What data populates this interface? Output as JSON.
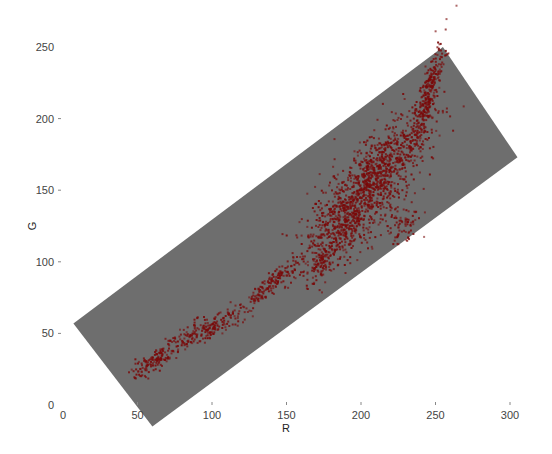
{
  "chart_data": {
    "type": "scatter",
    "title": "",
    "xlabel": "R",
    "ylabel": "G",
    "xlim": [
      0,
      300
    ],
    "ylim": [
      0,
      250
    ],
    "x_ticks": [
      0,
      50,
      100,
      150,
      200,
      250,
      300
    ],
    "y_ticks": [
      0,
      50,
      100,
      150,
      200,
      250
    ],
    "grid": false,
    "legend": null,
    "background_band": {
      "color": "#6e6e6e",
      "corners_rg": [
        [
          7,
          57
        ],
        [
          255,
          250
        ],
        [
          305,
          173
        ],
        [
          60,
          -15
        ]
      ]
    },
    "point_color": "#7a0a0a",
    "series": [
      {
        "name": "pixels",
        "clusters": [
          {
            "center": [
              210,
              160
            ],
            "spread": [
              18,
              22
            ],
            "n": 900,
            "corr": 0.75
          },
          {
            "center": [
              190,
              130
            ],
            "spread": [
              14,
              16
            ],
            "n": 500,
            "corr": 0.6
          },
          {
            "center": [
              245,
              215
            ],
            "spread": [
              5,
              18
            ],
            "n": 300,
            "corr": 0.8
          },
          {
            "center": [
              175,
              100
            ],
            "spread": [
              6,
              8
            ],
            "n": 120,
            "corr": 0.5
          },
          {
            "center": [
              228,
              125
            ],
            "spread": [
              6,
              6
            ],
            "n": 80,
            "corr": 0.3
          },
          {
            "center": [
              140,
              85
            ],
            "spread": [
              10,
              9
            ],
            "n": 160,
            "corr": 0.9
          },
          {
            "center": [
              95,
              52
            ],
            "spread": [
              14,
              8
            ],
            "n": 220,
            "corr": 0.85
          },
          {
            "center": [
              60,
              30
            ],
            "spread": [
              8,
              6
            ],
            "n": 120,
            "corr": 0.8
          }
        ]
      }
    ]
  },
  "axes": {
    "x_title": "R",
    "y_title": "G",
    "x_labels": [
      "0",
      "50",
      "100",
      "150",
      "200",
      "250",
      "300"
    ],
    "y_labels": [
      "0",
      "50",
      "100",
      "150",
      "200",
      "250"
    ]
  }
}
